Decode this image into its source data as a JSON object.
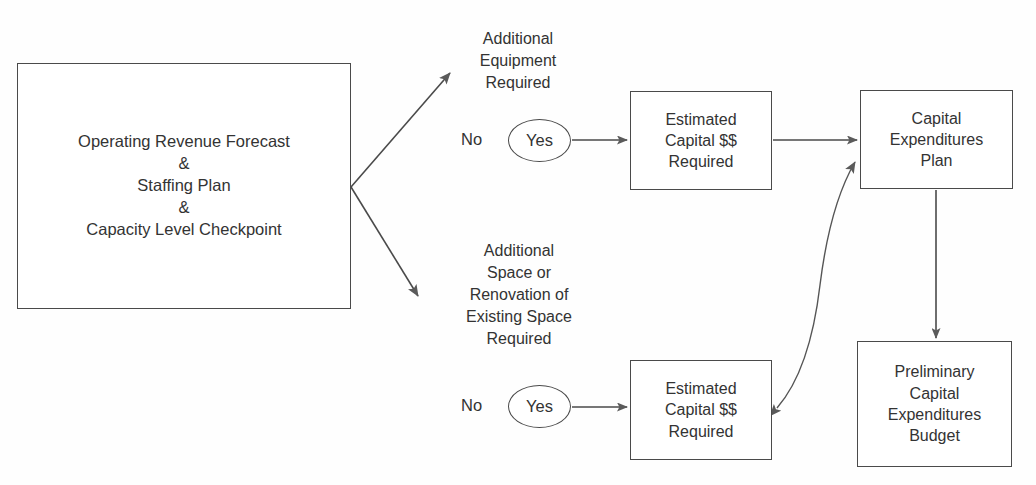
{
  "diagram": {
    "nodes": {
      "main": "Operating Revenue Forecast\n&\nStaffing Plan\n&\nCapacity Level Checkpoint",
      "estimated_upper": "Estimated\nCapital $$\nRequired",
      "estimated_lower": "Estimated\nCapital $$\nRequired",
      "capital_plan": "Capital\nExpenditures\nPlan",
      "preliminary_budget": "Preliminary\nCapital\nExpenditures\nBudget"
    },
    "branch_labels": {
      "equipment": "Additional\nEquipment\nRequired",
      "space": "Additional\nSpace or\nRenovation of\nExisting Space\nRequired"
    },
    "decisions": {
      "no_upper": "No",
      "yes_upper": "Yes",
      "no_lower": "No",
      "yes_lower": "Yes"
    },
    "colors": {
      "stroke": "#4a4a4a",
      "text": "#333333",
      "background": "#fefefe",
      "arrow_fill": "#5a5a5a"
    }
  }
}
